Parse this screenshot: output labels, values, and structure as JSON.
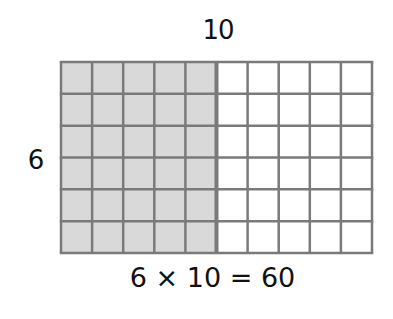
{
  "diagram": {
    "top_label": "10",
    "side_label": "6",
    "equation": "6 × 10 = 60",
    "grid": {
      "rows": 6,
      "columns": 10,
      "shaded_columns": 5,
      "shaded_color": "#d9d9d9",
      "unshaded_color": "#ffffff",
      "line_color": "#7a7a7a"
    }
  }
}
